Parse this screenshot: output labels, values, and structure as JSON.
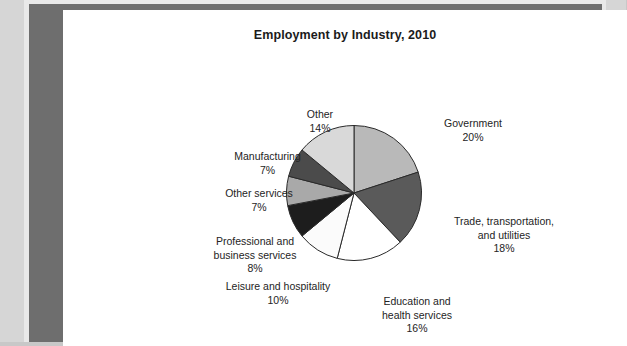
{
  "page": {
    "title": "Employment by Industry, 2010"
  },
  "chart_data": {
    "type": "pie",
    "title": "Employment by Industry, 2010",
    "xlabel": "",
    "ylabel": "",
    "grid": false,
    "legend": "none",
    "labels_position": "outside-callout",
    "start_angle_deg": 0,
    "direction": "clockwise",
    "categories": [
      "Government",
      "Trade, transportation, and utilities",
      "Education and health services",
      "Leisure and hospitality",
      "Professional and business services",
      "Other services",
      "Manufacturing",
      "Other"
    ],
    "values": [
      20,
      18,
      16,
      10,
      8,
      7,
      7,
      14
    ],
    "units": "percent",
    "slices": [
      {
        "name": "Government",
        "label_line1": "Government",
        "percent_text": "20%",
        "value": 20,
        "color": "#b9b9b9"
      },
      {
        "name": "Trade, transportation, and utilities",
        "label_line1": "Trade, transportation,",
        "label_line2": "and utilities",
        "percent_text": "18%",
        "value": 18,
        "color": "#5a5a5a"
      },
      {
        "name": "Education and health services",
        "label_line1": "Education and",
        "label_line2": "health services",
        "percent_text": "16%",
        "value": 16,
        "color": "#ffffff"
      },
      {
        "name": "Leisure and hospitality",
        "label_line1": "Leisure and hospitality",
        "percent_text": "10%",
        "value": 10,
        "color": "#fbfbfb"
      },
      {
        "name": "Professional and business services",
        "label_line1": "Professional and",
        "label_line2": "business services",
        "percent_text": "8%",
        "value": 8,
        "color": "#1d1d1d"
      },
      {
        "name": "Other services",
        "label_line1": "Other services",
        "percent_text": "7%",
        "value": 7,
        "color": "#a9a9a9"
      },
      {
        "name": "Manufacturing",
        "label_line1": "Manufacturing",
        "percent_text": "7%",
        "value": 7,
        "color": "#4b4b4b"
      },
      {
        "name": "Other",
        "label_line1": "Other",
        "percent_text": "14%",
        "value": 14,
        "color": "#d9d9d9"
      }
    ]
  },
  "colors": {
    "page_background": "#ffffff",
    "scan_background": "#d6d6d6",
    "border": "#6e6e6e",
    "text": "#242424",
    "title": "#1b1b1b",
    "slice_outline": "#2a2a2a"
  }
}
